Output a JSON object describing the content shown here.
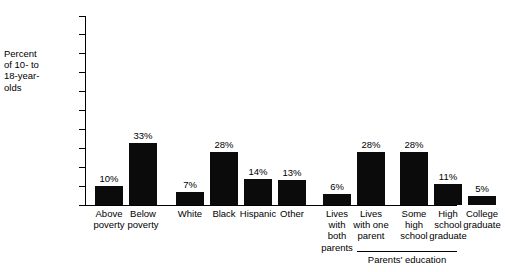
{
  "chart_data": {
    "type": "bar",
    "title": "",
    "xlabel": "",
    "ylabel": "Percent of 10- to 18-year-olds",
    "ylim": [
      0,
      100
    ],
    "ytick_labels": [
      "100%",
      "90%",
      "80%",
      "70%",
      "60%",
      "50%",
      "40%",
      "30%",
      "20%",
      "10%",
      "0%"
    ],
    "ytick_values": [
      100,
      90,
      80,
      70,
      60,
      50,
      40,
      30,
      20,
      10,
      0
    ],
    "grid": false,
    "legend": "none",
    "bar_color": "#0b0b0b",
    "categories": [
      "Above poverty",
      "Below poverty",
      "White",
      "Black",
      "Hispanic",
      "Other",
      "Lives with both parents",
      "Lives with one parent",
      "Some high school",
      "High school graduate",
      "College graduate"
    ],
    "values": [
      10,
      33,
      7,
      28,
      14,
      13,
      6,
      28,
      28,
      11,
      5
    ],
    "value_labels": [
      "10%",
      "33%",
      "7%",
      "28%",
      "14%",
      "13%",
      "6%",
      "28%",
      "28%",
      "11%",
      "5%"
    ],
    "groups": [
      {
        "name": "Poverty status",
        "indices": [
          0,
          1
        ],
        "bracket_label": ""
      },
      {
        "name": "Race/ethnicity",
        "indices": [
          2,
          3,
          4,
          5
        ],
        "bracket_label": ""
      },
      {
        "name": "Family structure",
        "indices": [
          6,
          7
        ],
        "bracket_label": ""
      },
      {
        "name": "Parents' education",
        "indices": [
          8,
          9,
          10
        ],
        "bracket_label": "Parents' education"
      }
    ]
  },
  "axis": {
    "y_title_lines": [
      "Percent",
      "of 10- to",
      "18-year-",
      "olds"
    ]
  },
  "category_label_lines": [
    [
      "Above",
      "poverty"
    ],
    [
      "Below",
      "poverty"
    ],
    [
      "White"
    ],
    [
      "Black"
    ],
    [
      "Hispanic"
    ],
    [
      "Other"
    ],
    [
      "Lives",
      "with",
      "both",
      "parents"
    ],
    [
      "Lives",
      "with one",
      "parent"
    ],
    [
      "Some",
      "high",
      "school"
    ],
    [
      "High",
      "school",
      "graduate"
    ],
    [
      "College",
      "graduate"
    ]
  ],
  "bracket": {
    "label": "Parents' education"
  }
}
